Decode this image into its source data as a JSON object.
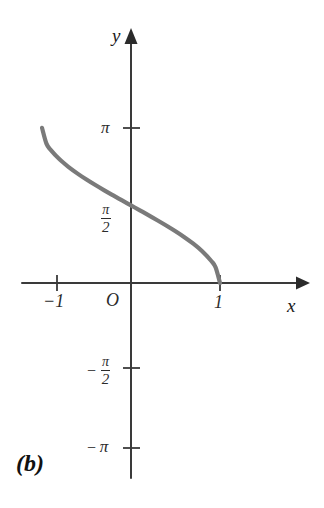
{
  "chart_data": {
    "type": "line",
    "title": "",
    "subtitle": "",
    "panel_label": "(b)",
    "function": "y = arccos(x)",
    "xlabel": "x",
    "ylabel": "y",
    "xlim": [
      -1.45,
      1.55
    ],
    "ylim": [
      -3.6,
      4.2
    ],
    "grid": false,
    "legend": null,
    "x_ticks": [
      {
        "value": -1,
        "label": "−1"
      },
      {
        "value": 0,
        "label": "O"
      },
      {
        "value": 1,
        "label": "1"
      }
    ],
    "y_ticks": [
      {
        "value": 3.1416,
        "label": "π",
        "kind": "plain"
      },
      {
        "value": 1.5708,
        "label": "π/2",
        "kind": "fraction",
        "numerator": "π",
        "denominator": "2",
        "negative": false
      },
      {
        "value": -1.5708,
        "label": "−π/2",
        "kind": "fraction",
        "numerator": "π",
        "denominator": "2",
        "negative": true
      },
      {
        "value": -3.1416,
        "label": "−π",
        "kind": "plain",
        "negative": true
      }
    ],
    "series": [
      {
        "name": "arccos",
        "color": "#7a7a7a",
        "x": [
          -1.0,
          -0.95,
          -0.9,
          -0.8,
          -0.7,
          -0.6,
          -0.5,
          -0.4,
          -0.3,
          -0.2,
          -0.1,
          0.0,
          0.1,
          0.2,
          0.3,
          0.4,
          0.5,
          0.6,
          0.7,
          0.8,
          0.9,
          0.95,
          1.0
        ],
        "values": [
          3.1416,
          2.8208,
          2.6906,
          2.4981,
          2.3462,
          2.2143,
          2.0944,
          1.9823,
          1.8755,
          1.7722,
          1.671,
          1.5708,
          1.4706,
          1.3694,
          1.2661,
          1.1593,
          1.0472,
          0.9273,
          0.7954,
          0.6435,
          0.451,
          0.3176,
          0.0
        ]
      }
    ],
    "endpoints": [
      {
        "x": -1,
        "y": 3.1416,
        "note": "left endpoint at y = π"
      },
      {
        "x": 1,
        "y": 0,
        "note": "right endpoint at x-axis"
      }
    ],
    "axis_arrows": {
      "x_positive": true,
      "y_positive": true
    }
  },
  "labels": {
    "pi": "π",
    "pi_numerator": "π",
    "half_denominator": "2",
    "minus": "−",
    "neg_one": "−1",
    "origin": "O",
    "one": "1",
    "x_axis": "x",
    "y_axis": "y",
    "caption": "(b)"
  },
  "colors": {
    "background": "#ffffff",
    "axis": "#3a3a3a",
    "curve": "#7a7a7a",
    "text": "#2b2b2b"
  }
}
